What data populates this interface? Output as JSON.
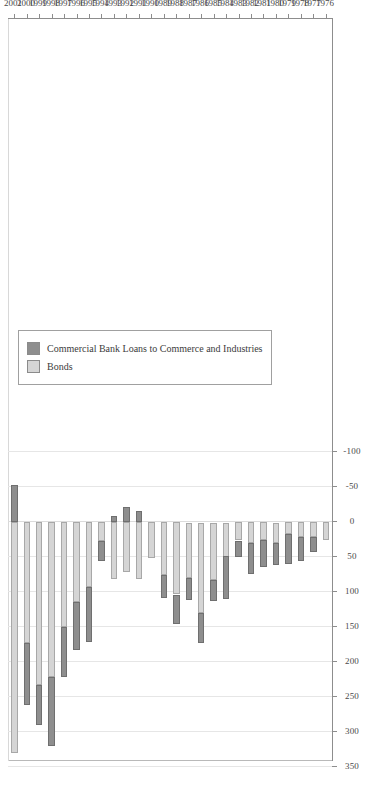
{
  "chart_data": {
    "type": "bar",
    "orientation": "horizontal-stacked",
    "title": "",
    "xlabel": "",
    "ylabel": "",
    "xlim": [
      350,
      -100
    ],
    "xticks": [
      350,
      300,
      250,
      200,
      150,
      100,
      50,
      0,
      -50,
      -100
    ],
    "xtick_labels": [
      "350",
      "300",
      "250",
      "200",
      "150",
      "100",
      "50",
      "0",
      "-50",
      "-100"
    ],
    "grid": true,
    "legend_position": "bottom-left",
    "categories": [
      "2001",
      "2000",
      "1999",
      "1998",
      "1997",
      "1996",
      "1995",
      "1994",
      "1993",
      "1992",
      "1991",
      "1990",
      "1989",
      "1988",
      "1987",
      "1986",
      "1985",
      "1984",
      "1983",
      "1982",
      "1981",
      "1980",
      "1979",
      "1978",
      "1977",
      "1976"
    ],
    "series": [
      {
        "name": "Commercial Bank Loans to Commerce and Industries",
        "color": "#8e8e8e",
        "values": [
          -53,
          88,
          57,
          99,
          71,
          68,
          78,
          28,
          -9,
          -21,
          -16,
          0,
          33,
          42,
          32,
          43,
          30,
          61,
          23,
          44,
          39,
          32,
          43,
          34,
          21,
          0
        ]
      },
      {
        "name": "Bonds",
        "color": "#d5d5d5",
        "values": [
          330,
          173,
          233,
          221,
          150,
          114,
          93,
          27,
          81,
          71,
          81,
          51,
          75,
          103,
          79,
          129,
          82,
          49,
          26,
          30,
          25,
          29,
          17,
          21,
          21,
          25
        ]
      }
    ]
  },
  "legend": {
    "items": [
      {
        "label": "Commercial Bank Loans to Commerce and Industries",
        "color": "#8e8e8e",
        "swatch_name": "legend-swatch-loans"
      },
      {
        "label": "Bonds",
        "color": "#d5d5d5",
        "swatch_name": "legend-swatch-bonds"
      }
    ]
  }
}
